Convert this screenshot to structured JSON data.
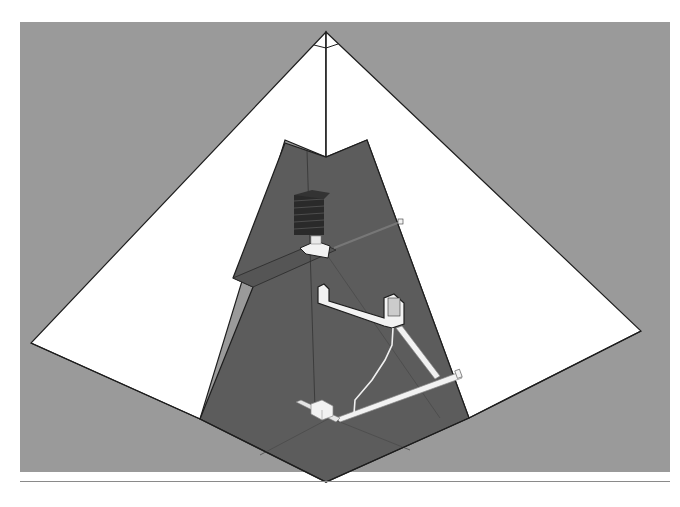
{
  "diagram": {
    "colors": {
      "background": "#9a9a9a",
      "face": "#ffffff",
      "cutaway": "#5c5c5c",
      "outline": "#1e1e1e",
      "passage": "#f2f2f2",
      "chamber_blocks": "#2a2a2a"
    },
    "elements": [
      {
        "id": "apex",
        "label": "apex"
      },
      {
        "id": "kings-chamber",
        "label": "relieving chambers stack"
      },
      {
        "id": "grand-gallery",
        "label": "gallery"
      },
      {
        "id": "queens-chamber",
        "label": "chamber"
      },
      {
        "id": "ascending-passage",
        "label": "ascending passage"
      },
      {
        "id": "descending-passage",
        "label": "descending passage"
      },
      {
        "id": "well-shaft",
        "label": "well shaft"
      },
      {
        "id": "subterranean-chamber",
        "label": "subterranean chamber"
      },
      {
        "id": "air-shaft",
        "label": "shaft"
      }
    ]
  }
}
